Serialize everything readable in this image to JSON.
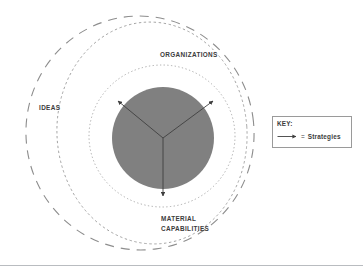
{
  "diagram": {
    "title_center": "HISTORICAL BLOC",
    "rings": [
      {
        "id": "ideas",
        "label": "IDEAS",
        "stroke": "#8d8d8d",
        "dash": "long-dash"
      },
      {
        "id": "organizations",
        "label": "ORGANIZATIONS",
        "stroke": "#8d8d8d",
        "dash": "dash"
      },
      {
        "id": "material_capabilities",
        "label": "MATERIAL CAPABILITIES",
        "stroke": "#9a9a9a",
        "dash": "dot"
      }
    ],
    "center": {
      "label": "HISTORICAL BLOC",
      "fill": "#808080",
      "text_color": "#ffffff"
    },
    "arrows": [
      {
        "name": "arrow-upper-left",
        "from_label": "HISTORICAL BLOC",
        "to_label": "IDEAS"
      },
      {
        "name": "arrow-upper-right",
        "from_label": "HISTORICAL BLOC",
        "to_label": "ORGANIZATIONS"
      },
      {
        "name": "arrow-down",
        "from_label": "HISTORICAL BLOC",
        "to_label": "MATERIAL CAPABILITIES"
      }
    ],
    "arrow_color": "#3f3f3f"
  },
  "key": {
    "title": "KEY:",
    "equals": "=",
    "entry_label": "Strategies",
    "border_color": "#9a9a9a"
  },
  "labels": {
    "ideas": "IDEAS",
    "organizations": "ORGANIZATIONS",
    "material_capabilities": "MATERIAL CAPABILITIES",
    "historical_bloc": "HISTORICAL BLOC"
  },
  "colors": {
    "background": "#ffffff",
    "center_fill": "#808080",
    "ring_stroke": "#8d8d8d",
    "text": "#3c3c3c",
    "divider": "#b9bcc0"
  }
}
